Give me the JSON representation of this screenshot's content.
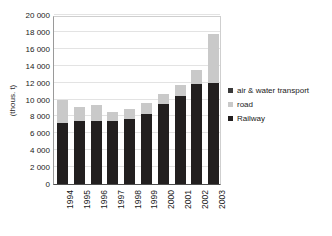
{
  "chart_data": {
    "type": "bar",
    "title": "",
    "subtitle": "",
    "xlabel": "",
    "ylabel": "(thous. t)",
    "stacked": true,
    "grid": true,
    "legend_position": "right",
    "ylim": [
      0,
      20000
    ],
    "ytick_step": 2000,
    "ytick_labels": [
      "20 000",
      "18 000",
      "16 000",
      "14 000",
      "12 000",
      "10 000",
      "8 000",
      "6 000",
      "4 000",
      "2 000",
      "0"
    ],
    "ytick_values": [
      20000,
      18000,
      16000,
      14000,
      12000,
      10000,
      8000,
      6000,
      4000,
      2000,
      0
    ],
    "categories": [
      "1994",
      "1995",
      "1996",
      "1997",
      "1998",
      "1999",
      "2000",
      "2001",
      "2002",
      "2003"
    ],
    "series": [
      {
        "name": "Railway",
        "color": "#221f1f",
        "values": [
          7200,
          7400,
          7500,
          7400,
          7700,
          8300,
          9500,
          10400,
          11800,
          11900
        ]
      },
      {
        "name": "road",
        "color": "#c9c9c9",
        "values": [
          2800,
          1700,
          1900,
          1100,
          1200,
          1300,
          1200,
          1300,
          1700,
          5800
        ]
      },
      {
        "name": "air & water transport",
        "color": "#3a3a3a",
        "values": [
          0,
          0,
          0,
          0,
          0,
          0,
          0,
          0,
          0,
          0
        ]
      }
    ],
    "totals": [
      10000,
      9100,
      9400,
      8500,
      8900,
      9600,
      10700,
      11700,
      13500,
      17700
    ]
  },
  "legend": {
    "items": [
      {
        "label": "air & water transport",
        "color": "#3a3a3a"
      },
      {
        "label": "road",
        "color": "#c9c9c9"
      },
      {
        "label": "Railway",
        "color": "#221f1f"
      }
    ]
  }
}
